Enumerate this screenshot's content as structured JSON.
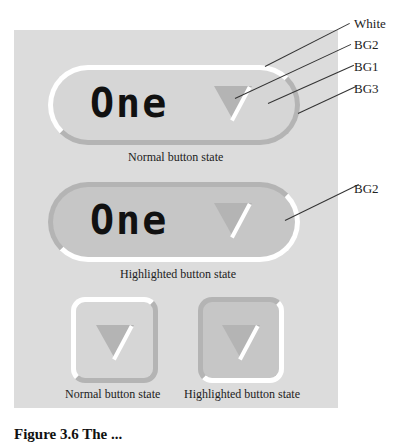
{
  "colors": {
    "white": "#ffffff",
    "bg1": "#d6d6d6",
    "bg2": "#c6c6c6",
    "bg3": "#b4b4b4",
    "panel": "#dcdcdc"
  },
  "pill_buttons": [
    {
      "state": "normal",
      "text": "One",
      "caption": "Normal button state"
    },
    {
      "state": "highlighted",
      "text": "One",
      "caption": "Highlighted button state"
    }
  ],
  "square_buttons": [
    {
      "state": "normal",
      "caption": "Normal button state"
    },
    {
      "state": "highlighted",
      "caption": "Highlighted button state"
    }
  ],
  "callouts": {
    "normal": [
      "White",
      "BG2",
      "BG1",
      "BG3"
    ],
    "highlighted": [
      "BG2"
    ]
  },
  "figure_caption": "Figure 3.6  The ..."
}
